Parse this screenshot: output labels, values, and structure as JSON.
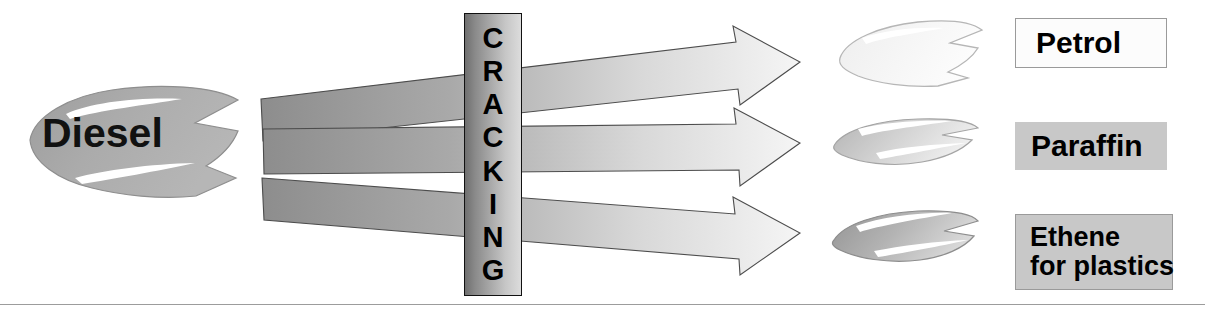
{
  "diagram": {
    "process": {
      "name": "CRACKING",
      "letters": [
        "C",
        "R",
        "A",
        "C",
        "K",
        "I",
        "N",
        "G"
      ],
      "orientation": "vertical",
      "box_fill_left": "#6f6f6f",
      "box_fill_right": "#dcdcdc",
      "border_color": "#111111"
    },
    "input": {
      "label": "Diesel",
      "shape": "blob-arrow",
      "fill": "#a8a8a8",
      "highlight": "#ffffff",
      "outline": "#8c8c8c"
    },
    "arrows": [
      {
        "name": "arrow-to-petrol",
        "from": "Diesel",
        "to": "Petrol",
        "direction": "right",
        "fill_start": "#8f8f8f",
        "fill_end": "#f4f4f4",
        "outline": "#4a4a4a"
      },
      {
        "name": "arrow-to-paraffin",
        "from": "Diesel",
        "to": "Paraffin",
        "direction": "right",
        "fill_start": "#8f8f8f",
        "fill_end": "#f4f4f4",
        "outline": "#4a4a4a"
      },
      {
        "name": "arrow-to-ethene",
        "from": "Diesel",
        "to": "Ethene for plastics",
        "direction": "right",
        "fill_start": "#8f8f8f",
        "fill_end": "#f4f4f4",
        "outline": "#4a4a4a"
      }
    ],
    "outputs": [
      {
        "name": "petrol",
        "label_lines": [
          "Petrol"
        ],
        "label_bg": "#fcfcfc",
        "label_border": "#9a9a9a",
        "blob_fill_start": "#f2f2f2",
        "blob_fill_end": "#fbfbfb",
        "blob_outline": "#b4b4b4"
      },
      {
        "name": "paraffin",
        "label_lines": [
          "Paraffin"
        ],
        "label_bg": "#c8c8c8",
        "label_border": "none",
        "blob_fill_start": "#b9b9b9",
        "blob_fill_end": "#ededed",
        "blob_outline": "#a0a0a0"
      },
      {
        "name": "ethene",
        "label_lines": [
          "Ethene",
          "for plastics"
        ],
        "label_bg": "#c8c8c8",
        "label_border": "#9a9a9a",
        "blob_fill_start": "#9a9a9a",
        "blob_fill_end": "#d8d8d8",
        "blob_outline": "#8a8a8a"
      }
    ],
    "footer_rule_color": "#9c9c9c"
  }
}
